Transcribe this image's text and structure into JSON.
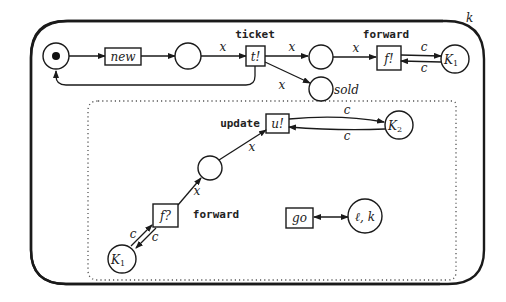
{
  "diagram": {
    "type": "petri-net",
    "boundary_label": "k",
    "places": {
      "start": {
        "label": "",
        "token": true
      },
      "after_new": {
        "label": ""
      },
      "after_ticket": {
        "label": ""
      },
      "sold": {
        "label": "sold"
      },
      "k1_top": {
        "label": "K",
        "sub": "1"
      },
      "k2": {
        "label": "K",
        "sub": "2"
      },
      "middle": {
        "label": ""
      },
      "k1_bottom": {
        "label": "K",
        "sub": "1"
      },
      "location": {
        "label": "ℓ, k"
      }
    },
    "transitions": {
      "new": {
        "label": "new"
      },
      "ticket": {
        "label": "t!",
        "name": "ticket"
      },
      "forward_send": {
        "label": "f!",
        "name": "forward"
      },
      "update": {
        "label": "u!",
        "name": "update"
      },
      "forward_recv": {
        "label": "f?",
        "name": "forward"
      },
      "go": {
        "label": "go"
      }
    },
    "arc_labels": {
      "new_to_ticket": "x",
      "ticket_to_place": "x",
      "ticket_to_sold": "x",
      "place_to_forward": "x",
      "forward_k1_out": "c",
      "forward_k1_in": "c",
      "update_k2_out": "c",
      "update_k2_in": "c",
      "middle_to_update": "x",
      "fwdrecv_to_middle": "x",
      "k1b_to_fwdrecv": "c",
      "fwdrecv_to_k1b": "c"
    }
  }
}
